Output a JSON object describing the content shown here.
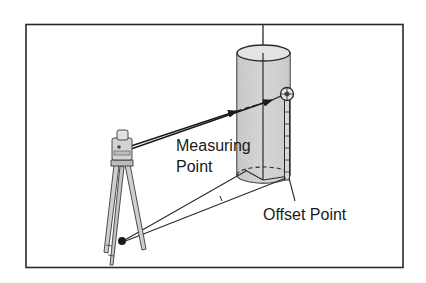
{
  "diagram": {
    "type": "surveying-offset-measurement",
    "labels": {
      "measuring_point_line1": "Measuring",
      "measuring_point_line2": "Point",
      "offset_point": "Offset Point"
    },
    "elements": [
      {
        "name": "frame",
        "shape": "rectangle"
      },
      {
        "name": "cylinder-target",
        "shape": "cylinder"
      },
      {
        "name": "prism-pole",
        "shape": "pole-with-prism"
      },
      {
        "name": "total-station",
        "shape": "instrument-on-tripod"
      },
      {
        "name": "ground-point",
        "shape": "filled-circle"
      }
    ],
    "colors": {
      "line": "#2a2a2a",
      "cylinder_fill": "#cfcfcf",
      "cylinder_top": "#e4e4e4",
      "background": "#ffffff"
    }
  }
}
